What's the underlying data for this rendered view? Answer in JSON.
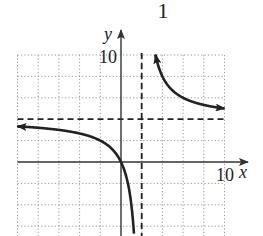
{
  "header_fragment": "1",
  "chart_data": {
    "type": "line",
    "title": "",
    "function": "y = 4x/(x - 2)",
    "xlabel": "x",
    "ylabel": "y",
    "xlim": [
      -10,
      10
    ],
    "ylim": [
      -14,
      10
    ],
    "grid": true,
    "grid_step": 2,
    "tick_labels": {
      "x": "10",
      "y": "10"
    },
    "asymptotes": {
      "vertical_x": 2,
      "horizontal_y": 4
    },
    "series": [
      {
        "name": "left-branch",
        "x_range": [
          -10,
          1.6
        ],
        "arrow_start": true,
        "arrow_end": false
      },
      {
        "name": "right-branch",
        "x_range": [
          3.33,
          10
        ],
        "arrow_start": true,
        "arrow_end": true
      }
    ],
    "colors": {
      "curve": "#222222",
      "axis": "#333333",
      "grid": "#999999",
      "asymptote": "#222222"
    }
  }
}
